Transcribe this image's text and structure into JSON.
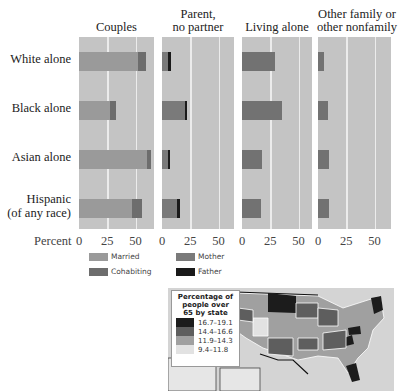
{
  "chart_data": {
    "type": "bar",
    "subtype": "horizontal stacked, small multiples",
    "row_categories": [
      "White alone",
      "Black alone",
      "Asian alone",
      "Hispanic (of any race)"
    ],
    "panels": [
      {
        "title": "Couples",
        "series": [
          {
            "name": "Married",
            "values": [
              52,
              27,
              60,
              47
            ]
          },
          {
            "name": "Cohabiting",
            "values": [
              7,
              6,
              4,
              9
            ]
          }
        ]
      },
      {
        "title": "Parent, no partner",
        "series": [
          {
            "name": "Mother",
            "values": [
              5,
              20,
              5,
              13
            ]
          },
          {
            "name": "Father",
            "values": [
              3,
              2,
              1,
              3
            ]
          }
        ]
      },
      {
        "title": "Living alone",
        "series": [
          {
            "name": "Living alone",
            "values": [
              29,
              35,
              18,
              17
            ]
          }
        ]
      },
      {
        "title": "Other family or other nonfamily",
        "series": [
          {
            "name": "Other",
            "values": [
              5,
              9,
              10,
              10
            ]
          }
        ]
      }
    ],
    "xlabel": "Percent",
    "xticks": [
      0,
      25,
      50
    ],
    "xlim": [
      0,
      65
    ],
    "grid": true,
    "legend": [
      "Married",
      "Cohabiting",
      "Mother",
      "Father"
    ],
    "legend_position": "bottom"
  },
  "labels": {
    "panel_titles": [
      "Couples",
      "Parent,",
      "no partner",
      "Living alone",
      "Other family or",
      "other nonfamily"
    ],
    "rows": [
      "White alone",
      "Black alone",
      "Asian alone",
      "Hispanic",
      "(of any race)"
    ],
    "axis_label": "Percent",
    "ticks": [
      "0",
      "25",
      "50"
    ]
  },
  "legend": {
    "married": "Married",
    "cohabiting": "Cohabiting",
    "mother": "Mother",
    "father": "Father"
  },
  "colors": {
    "panel_bg": "#c4c4c4",
    "grid": "#ececec",
    "married": "#9a9a9a",
    "cohabiting": "#6d6d6d",
    "mother": "#7a7a7a",
    "father": "#1a1a1a",
    "single": "#727272"
  },
  "map": {
    "legend_title_1": "Percentage of",
    "legend_title_2": "people over",
    "legend_title_3": "65 by state",
    "bins": [
      {
        "label": "16.7–19.1",
        "color": "#1c1c1c"
      },
      {
        "label": "14.4–16.6",
        "color": "#5e5e5e"
      },
      {
        "label": "11.9–14.3",
        "color": "#a0a0a0"
      },
      {
        "label": "9.4–11.8",
        "color": "#e2e2e2"
      }
    ]
  }
}
